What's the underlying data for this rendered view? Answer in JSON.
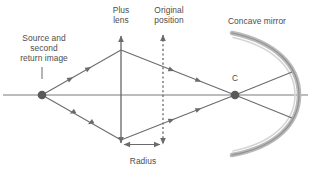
{
  "diagram": {
    "labels": {
      "source": "Source and\nsecond\nreturn image",
      "plus_lens": "Plus\nlens",
      "original_position": "Original\nposition",
      "concave_mirror": "Concave mirror",
      "radius": "Radius",
      "center_of_curvature": "C"
    },
    "colors": {
      "line": "#6b6b6b",
      "axis": "#7a7a7a",
      "dot": "#5a5a5a",
      "mirror_outer": "#a8a8a8",
      "mirror_inner": "#d2d2d2",
      "text": "#4d4d4d",
      "background": "#ffffff"
    },
    "geometry": {
      "axis_y": 95,
      "axis_x_start": 3,
      "axis_x_end": 308,
      "source_x": 42,
      "source_y": 95,
      "lens_x": 121,
      "lens_top_y": 32,
      "lens_bottom_y": 147,
      "original_position_x": 163,
      "original_position_top_y": 31,
      "original_position_bottom_y": 148,
      "c_x": 235,
      "c_y": 95,
      "cone_top_y": 50,
      "cone_bottom_y": 140,
      "mirror_arc_top": [
        232,
        33
      ],
      "mirror_arc_bottom": [
        232,
        155
      ],
      "mirror_arc_apex_x": 297,
      "radius_arrow_y": 144,
      "radius_arrow_x1": 121,
      "radius_arrow_x2": 163
    },
    "elements": [
      {
        "name": "optical-axis",
        "type": "line"
      },
      {
        "name": "source-point",
        "type": "dot"
      },
      {
        "name": "center-of-curvature-point",
        "type": "dot"
      },
      {
        "name": "plus-lens",
        "type": "double-arrow-line"
      },
      {
        "name": "original-position-line",
        "type": "dashed-double-arrow-line"
      },
      {
        "name": "concave-mirror",
        "type": "arc"
      },
      {
        "name": "ray-upper-left",
        "type": "ray",
        "direction": "toward-lens"
      },
      {
        "name": "ray-lower-left",
        "type": "ray",
        "direction": "toward-source"
      },
      {
        "name": "ray-upper-right",
        "type": "ray",
        "direction": "toward-c"
      },
      {
        "name": "ray-lower-right",
        "type": "ray",
        "direction": "toward-c"
      },
      {
        "name": "ray-c-to-mirror-upper",
        "type": "ray"
      },
      {
        "name": "ray-c-to-mirror-lower",
        "type": "ray"
      },
      {
        "name": "radius-dimension-arrow",
        "type": "double-arrow"
      }
    ]
  }
}
